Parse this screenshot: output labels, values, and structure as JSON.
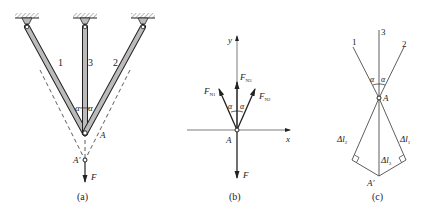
{
  "panel_a": {
    "caption": "(a)",
    "bar_labels": [
      "1",
      "3",
      "2"
    ],
    "angle_label": "α",
    "node_label": "A",
    "displaced_node_label": "A′",
    "load_label": "F"
  },
  "panel_b": {
    "caption": "(b)",
    "axis_x": "x",
    "axis_y": "y",
    "origin_label": "A",
    "force_n1": "F",
    "force_n1_sub": "N1",
    "force_n2": "F",
    "force_n2_sub": "N2",
    "force_n3": "F",
    "force_n3_sub": "N3",
    "load_label": "F",
    "angle_label": "α"
  },
  "panel_c": {
    "caption": "(c)",
    "line_labels": [
      "1",
      "3",
      "2"
    ],
    "angle_label": "α",
    "node_label": "A",
    "displaced_node_label": "A′",
    "dl1": "Δl",
    "dl1_sub": "1",
    "dl2": "Δl",
    "dl2_sub": "2",
    "dl3": "Δl",
    "dl3_sub": "3"
  },
  "colors": {
    "line": "#222222",
    "bar_fill": "#b8b8b8",
    "hatch": "#888888"
  }
}
